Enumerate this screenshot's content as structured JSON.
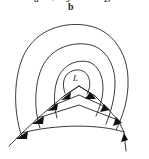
{
  "figure": {
    "background_color": "#ffffff",
    "stroke_color": "#232323",
    "arrow_fill_color": "#101010",
    "width": 149,
    "height": 159
  },
  "top_labels": {
    "clipped_note": "upper label row is cut off by the top edge of the screenshot",
    "a": "a",
    "operator": "+",
    "s": "s",
    "B": "B",
    "b": "b"
  },
  "loop": {
    "label": "L"
  },
  "contours": {
    "count": 3,
    "names": [
      "outer-contour",
      "middle-contour",
      "inner-contour"
    ]
  },
  "field_lines": {
    "count": 4,
    "arrow_count": 8,
    "left_tail_label": "",
    "right_tail_label": ""
  }
}
